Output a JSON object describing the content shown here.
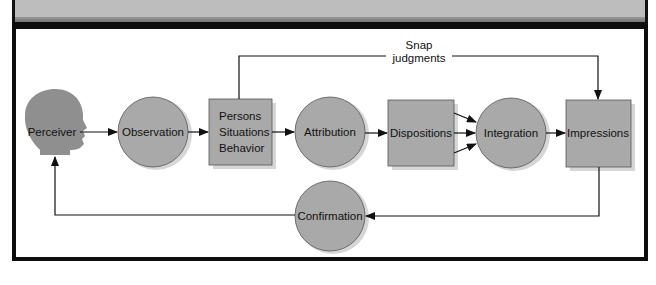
{
  "diagram": {
    "nodes": [
      {
        "id": "perceiver",
        "label": "Perceiver",
        "shape": "head"
      },
      {
        "id": "observation",
        "label": "Observation",
        "shape": "circle"
      },
      {
        "id": "psb",
        "label_lines": [
          "Persons",
          "Situations",
          "Behavior"
        ],
        "shape": "box"
      },
      {
        "id": "attribution",
        "label": "Attribution",
        "shape": "circle"
      },
      {
        "id": "dispositions",
        "label": "Dispositions",
        "shape": "box"
      },
      {
        "id": "integration",
        "label": "Integration",
        "shape": "circle"
      },
      {
        "id": "impressions",
        "label": "Impressions",
        "shape": "box"
      },
      {
        "id": "confirmation",
        "label": "Confirmation",
        "shape": "circle"
      }
    ],
    "snap": {
      "line1": "Snap",
      "line2": "judgments"
    },
    "edges": [
      {
        "from": "perceiver",
        "to": "observation"
      },
      {
        "from": "observation",
        "to": "psb"
      },
      {
        "from": "psb",
        "to": "attribution"
      },
      {
        "from": "attribution",
        "to": "dispositions"
      },
      {
        "from": "dispositions",
        "to": "integration",
        "count": 3
      },
      {
        "from": "integration",
        "to": "impressions"
      },
      {
        "from": "psb",
        "to": "impressions",
        "label": "Snap judgments"
      },
      {
        "from": "impressions",
        "to": "confirmation"
      },
      {
        "from": "confirmation",
        "to": "perceiver"
      }
    ],
    "colors": {
      "node_fill": "#a9a9a9",
      "shadow": "#d6d6d6",
      "line": "#111111",
      "panel": "#bdbdbd"
    }
  }
}
